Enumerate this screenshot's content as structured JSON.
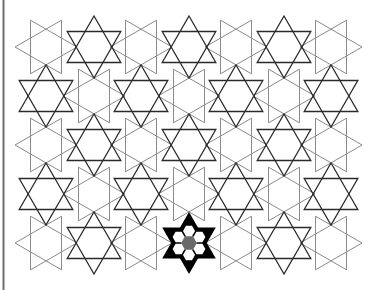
{
  "figure": {
    "width": 379,
    "height": 290,
    "background": "#ffffff",
    "border_color": "#6e6e6e",
    "dark_stroke": "#2a2a2a",
    "light_stroke": "#8a8a8a",
    "fill_highlight": "#000000",
    "radius": 31,
    "dark_stars": [
      [
        94,
        47
      ],
      [
        189,
        47
      ],
      [
        284,
        47
      ],
      [
        46,
        96
      ],
      [
        141,
        96
      ],
      [
        236,
        96
      ],
      [
        331,
        96
      ],
      [
        94,
        145
      ],
      [
        189,
        145
      ],
      [
        284,
        145
      ],
      [
        46,
        194
      ],
      [
        141,
        194
      ],
      [
        236,
        194
      ],
      [
        331,
        194
      ],
      [
        94,
        243
      ],
      [
        284,
        243
      ]
    ],
    "light_stars": [
      [
        46,
        47
      ],
      [
        141,
        47
      ],
      [
        236,
        47
      ],
      [
        331,
        47
      ],
      [
        94,
        96
      ],
      [
        189,
        96
      ],
      [
        284,
        96
      ],
      [
        46,
        145
      ],
      [
        141,
        145
      ],
      [
        236,
        145
      ],
      [
        331,
        145
      ],
      [
        94,
        194
      ],
      [
        189,
        194
      ],
      [
        284,
        194
      ],
      [
        46,
        243
      ],
      [
        141,
        243
      ],
      [
        236,
        243
      ],
      [
        331,
        243
      ]
    ],
    "highlighted_star": {
      "center": [
        189,
        243
      ],
      "holes": 6,
      "hole_color": "#ffffff",
      "center_color": "#6a6a6a"
    }
  }
}
